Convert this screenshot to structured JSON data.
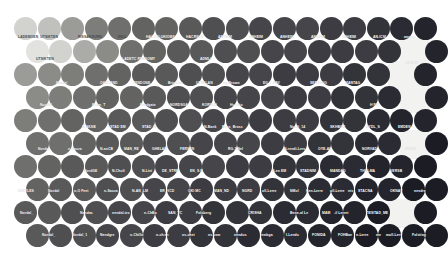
{
  "figure": {
    "kind": "dot-matrix-cartogram",
    "background": "#ffffff",
    "width": 438,
    "height": 260
  },
  "chart_data": {
    "type": "scatter",
    "title": "",
    "subtitle": "",
    "xlabel": "",
    "ylabel": "",
    "legend_position": "none",
    "grid": false,
    "packing": "hexagonal-offset-rows",
    "marker": "circle",
    "marker_diameter_px": 23,
    "row_pitch_px": 23,
    "col_pitch_px": 23.5,
    "rows": 10,
    "columns": 18,
    "colormap": {
      "name": "grayscale-sequential",
      "stops": [
        "#efefed",
        "#e2e2df",
        "#d2d2cf",
        "#c0c0bd",
        "#ababa8",
        "#9b9b98",
        "#8b8b88",
        "#7d7d7a",
        "#6f6f6d",
        "#636361",
        "#59595a",
        "#4f4f52",
        "#45454a",
        "#3c3c42",
        "#33333a",
        "#2b2b33",
        "#24242c",
        "#1c1c24"
      ],
      "direction": "light top-left to dark bottom-right"
    },
    "values": [
      [
        2,
        3,
        5,
        7,
        8,
        9,
        9,
        10,
        11,
        11,
        12,
        12,
        12,
        13,
        13,
        14,
        15,
        16
      ],
      [
        1,
        2,
        4,
        6,
        8,
        9,
        10,
        10,
        11,
        11,
        12,
        12,
        13,
        13,
        13,
        14,
        15,
        16
      ],
      [
        5,
        6,
        7,
        8,
        9,
        10,
        10,
        11,
        11,
        12,
        12,
        13,
        13,
        13,
        14,
        14,
        15,
        16
      ],
      [
        6,
        7,
        8,
        9,
        9,
        10,
        11,
        11,
        12,
        12,
        12,
        13,
        13,
        14,
        14,
        15,
        15,
        16
      ],
      [
        7,
        8,
        9,
        9,
        10,
        10,
        11,
        11,
        12,
        12,
        13,
        13,
        13,
        14,
        14,
        15,
        16,
        16
      ],
      [
        8,
        8,
        9,
        10,
        10,
        11,
        11,
        12,
        12,
        12,
        13,
        13,
        14,
        14,
        15,
        15,
        16,
        17
      ],
      [
        8,
        9,
        10,
        10,
        11,
        11,
        12,
        12,
        12,
        13,
        13,
        14,
        14,
        15,
        15,
        16,
        16,
        17
      ],
      [
        9,
        10,
        10,
        11,
        11,
        12,
        12,
        13,
        13,
        13,
        14,
        14,
        15,
        15,
        16,
        16,
        17,
        17
      ],
      [
        10,
        10,
        11,
        11,
        12,
        12,
        13,
        13,
        14,
        14,
        14,
        15,
        15,
        16,
        16,
        17,
        17,
        17
      ],
      [
        10,
        11,
        11,
        12,
        12,
        13,
        13,
        14,
        14,
        15,
        15,
        15,
        16,
        16,
        17,
        17,
        17,
        17
      ]
    ],
    "gaps": [
      {
        "row": 1,
        "col": 16
      },
      {
        "row": 2,
        "col": 16
      },
      {
        "row": 3,
        "col": 16
      },
      {
        "row": 5,
        "col": 16
      },
      {
        "row": 8,
        "col": 16
      }
    ],
    "annotations": [
      {
        "text": "LADEMOEN_UTSIKTEN",
        "x": 18,
        "y": 36,
        "tone": "dark"
      },
      {
        "text": "RISSAKKURKI",
        "x": 78,
        "y": 36,
        "tone": "dark"
      },
      {
        "text": "DELL",
        "x": 118,
        "y": 36,
        "tone": "dark"
      },
      {
        "text": "HACASLUKIOMS",
        "x": 146,
        "y": 36,
        "tone": "light"
      },
      {
        "text": "HACRSLU",
        "x": 186,
        "y": 36,
        "tone": "light"
      },
      {
        "text": "ANHEIM",
        "x": 218,
        "y": 36,
        "tone": "light"
      },
      {
        "text": "ANHEIM",
        "x": 249,
        "y": 36,
        "tone": "light"
      },
      {
        "text": "ANHEIM",
        "x": 280,
        "y": 36,
        "tone": "light"
      },
      {
        "text": "ANHEIM",
        "x": 311,
        "y": 36,
        "tone": "light"
      },
      {
        "text": "ANHEIM",
        "x": 342,
        "y": 36,
        "tone": "light"
      },
      {
        "text": "AN-ICM",
        "x": 373,
        "y": 36,
        "tone": "light"
      },
      {
        "text": "anvain",
        "x": 404,
        "y": 36,
        "tone": "light"
      },
      {
        "text": "UTSIKTEN",
        "x": 36,
        "y": 58,
        "tone": "dark"
      },
      {
        "text": "LADETC RENSOMY",
        "x": 122,
        "y": 58,
        "tone": "light"
      },
      {
        "text": "ADMLI",
        "x": 200,
        "y": 58,
        "tone": "light"
      },
      {
        "text": "AN-ICM",
        "x": 405,
        "y": 62,
        "tone": "light"
      },
      {
        "text": "Nordal_",
        "x": 56,
        "y": 82,
        "tone": "light"
      },
      {
        "text": "OAKLAND",
        "x": 100,
        "y": 82,
        "tone": "light"
      },
      {
        "text": "TENDONE",
        "x": 133,
        "y": 82,
        "tone": "light"
      },
      {
        "text": "Brighton",
        "x": 168,
        "y": 82,
        "tone": "light"
      },
      {
        "text": "UTSELAN",
        "x": 196,
        "y": 82,
        "tone": "light"
      },
      {
        "text": "ng-Brown",
        "x": 223,
        "y": 82,
        "tone": "light"
      },
      {
        "text": "EG T_FAV",
        "x": 263,
        "y": 82,
        "tone": "light"
      },
      {
        "text": "SERSAVG",
        "x": 310,
        "y": 82,
        "tone": "light"
      },
      {
        "text": "MANTAG",
        "x": 345,
        "y": 82,
        "tone": "light"
      },
      {
        "text": "NordEL",
        "x": 40,
        "y": 104,
        "tone": "light"
      },
      {
        "text": "Brian_T",
        "x": 92,
        "y": 104,
        "tone": "light"
      },
      {
        "text": "Nordgate",
        "x": 140,
        "y": 104,
        "tone": "light"
      },
      {
        "text": "NORDSGA",
        "x": 170,
        "y": 104,
        "tone": "light"
      },
      {
        "text": "KORSLU",
        "x": 202,
        "y": 104,
        "tone": "light"
      },
      {
        "text": "Hustrio",
        "x": 230,
        "y": 104,
        "tone": "light"
      },
      {
        "text": "H FU",
        "x": 370,
        "y": 104,
        "tone": "light"
      },
      {
        "text": "N-AKSB",
        "x": 82,
        "y": 126,
        "tone": "light"
      },
      {
        "text": "STAD EM",
        "x": 110,
        "y": 126,
        "tone": "light"
      },
      {
        "text": "STAD_M",
        "x": 142,
        "y": 126,
        "tone": "light"
      },
      {
        "text": "N-Bank",
        "x": 204,
        "y": 126,
        "tone": "light"
      },
      {
        "text": "Rens_Bross",
        "x": 222,
        "y": 126,
        "tone": "light"
      },
      {
        "text": "Nordi_14",
        "x": 290,
        "y": 126,
        "tone": "light"
      },
      {
        "text": "SKHBOR",
        "x": 330,
        "y": 126,
        "tone": "light"
      },
      {
        "text": "HYDL_S",
        "x": 366,
        "y": 126,
        "tone": "light"
      },
      {
        "text": "EMDEN",
        "x": 398,
        "y": 126,
        "tone": "light"
      },
      {
        "text": "Nordal",
        "x": 38,
        "y": 148,
        "tone": "light"
      },
      {
        "text": "n-Sauza",
        "x": 68,
        "y": 148,
        "tone": "light"
      },
      {
        "text": "N-anCB",
        "x": 100,
        "y": 148,
        "tone": "light"
      },
      {
        "text": "MAN_RE",
        "x": 124,
        "y": 148,
        "tone": "light"
      },
      {
        "text": "GHELAN",
        "x": 152,
        "y": 148,
        "tone": "light"
      },
      {
        "text": "FERSEN",
        "x": 180,
        "y": 148,
        "tone": "light"
      },
      {
        "text": "RG-1/Nel",
        "x": 228,
        "y": 148,
        "tone": "light"
      },
      {
        "text": "N-rendi-Lerv",
        "x": 284,
        "y": 148,
        "tone": "light"
      },
      {
        "text": "OYE-AL",
        "x": 318,
        "y": 148,
        "tone": "light"
      },
      {
        "text": "NORVAD",
        "x": 362,
        "y": 148,
        "tone": "light"
      },
      {
        "text": "MHCM",
        "x": 405,
        "y": 148,
        "tone": "light"
      },
      {
        "text": "NordGE",
        "x": 84,
        "y": 170,
        "tone": "light"
      },
      {
        "text": "N-Chuli",
        "x": 112,
        "y": 170,
        "tone": "light"
      },
      {
        "text": "N-Livi",
        "x": 142,
        "y": 170,
        "tone": "light"
      },
      {
        "text": "DE_STRE",
        "x": 162,
        "y": 170,
        "tone": "light"
      },
      {
        "text": "EN_S.N",
        "x": 190,
        "y": 170,
        "tone": "light"
      },
      {
        "text": "N-en EM",
        "x": 272,
        "y": 170,
        "tone": "light"
      },
      {
        "text": "STADNIM",
        "x": 300,
        "y": 170,
        "tone": "light"
      },
      {
        "text": "MANDAG",
        "x": 330,
        "y": 170,
        "tone": "light"
      },
      {
        "text": "THOLMA",
        "x": 360,
        "y": 170,
        "tone": "light"
      },
      {
        "text": "VERSB",
        "x": 390,
        "y": 170,
        "tone": "light"
      },
      {
        "text": "NJETLES",
        "x": 18,
        "y": 190,
        "tone": "light"
      },
      {
        "text": "Nordal",
        "x": 48,
        "y": 190,
        "tone": "light"
      },
      {
        "text": "n-O Feet",
        "x": 74,
        "y": 190,
        "tone": "light"
      },
      {
        "text": "n-Sauza",
        "x": 104,
        "y": 190,
        "tone": "light"
      },
      {
        "text": "N-AN_LM",
        "x": 132,
        "y": 190,
        "tone": "light"
      },
      {
        "text": "ER_VCD",
        "x": 160,
        "y": 190,
        "tone": "light"
      },
      {
        "text": "OKI MC",
        "x": 188,
        "y": 190,
        "tone": "light"
      },
      {
        "text": "MAN_ND",
        "x": 214,
        "y": 190,
        "tone": "light"
      },
      {
        "text": "NGRD",
        "x": 242,
        "y": 190,
        "tone": "light"
      },
      {
        "text": "oll-Lerre",
        "x": 262,
        "y": 190,
        "tone": "light"
      },
      {
        "text": "NMol",
        "x": 290,
        "y": 190,
        "tone": "light"
      },
      {
        "text": "Ren-Lerre",
        "x": 306,
        "y": 190,
        "tone": "light"
      },
      {
        "text": "oll-Lerre",
        "x": 330,
        "y": 190,
        "tone": "light"
      },
      {
        "text": "nts",
        "x": 348,
        "y": 190,
        "tone": "light"
      },
      {
        "text": "STACNA",
        "x": 358,
        "y": 190,
        "tone": "light"
      },
      {
        "text": "OKNAV",
        "x": 390,
        "y": 190,
        "tone": "light"
      },
      {
        "text": "nevdre",
        "x": 414,
        "y": 190,
        "tone": "light"
      },
      {
        "text": "Nordal_",
        "x": 20,
        "y": 212,
        "tone": "light"
      },
      {
        "text": "Nandas",
        "x": 80,
        "y": 212,
        "tone": "light"
      },
      {
        "text": "nendal-tro",
        "x": 112,
        "y": 212,
        "tone": "light"
      },
      {
        "text": "n-ChBa",
        "x": 144,
        "y": 212,
        "tone": "light"
      },
      {
        "text": "SAN_VC",
        "x": 168,
        "y": 212,
        "tone": "light"
      },
      {
        "text": "Folsberg",
        "x": 196,
        "y": 212,
        "tone": "light"
      },
      {
        "text": "CRISHA",
        "x": 248,
        "y": 212,
        "tone": "light"
      },
      {
        "text": "Bene-al Le",
        "x": 290,
        "y": 212,
        "tone": "light"
      },
      {
        "text": "MAM",
        "x": 322,
        "y": 212,
        "tone": "light"
      },
      {
        "text": "-il Lerret",
        "x": 334,
        "y": 212,
        "tone": "light"
      },
      {
        "text": "TEISTAD_ME",
        "x": 366,
        "y": 212,
        "tone": "light"
      },
      {
        "text": "Nordal_",
        "x": 42,
        "y": 234,
        "tone": "light"
      },
      {
        "text": "Nordal_1",
        "x": 72,
        "y": 234,
        "tone": "light"
      },
      {
        "text": "Nendgre",
        "x": 100,
        "y": 234,
        "tone": "light"
      },
      {
        "text": "n-Chillo",
        "x": 130,
        "y": 234,
        "tone": "light"
      },
      {
        "text": "n-ch.en",
        "x": 156,
        "y": 234,
        "tone": "light"
      },
      {
        "text": "os-chet",
        "x": 182,
        "y": 234,
        "tone": "light"
      },
      {
        "text": "ns.com",
        "x": 208,
        "y": 234,
        "tone": "light"
      },
      {
        "text": "nendus",
        "x": 234,
        "y": 234,
        "tone": "light"
      },
      {
        "text": "tembga",
        "x": 260,
        "y": 234,
        "tone": "light"
      },
      {
        "text": "l-Lendu",
        "x": 286,
        "y": 234,
        "tone": "light"
      },
      {
        "text": "FONIDA",
        "x": 312,
        "y": 234,
        "tone": "light"
      },
      {
        "text": "FOHBae",
        "x": 338,
        "y": 234,
        "tone": "light"
      },
      {
        "text": "n-Lerre",
        "x": 356,
        "y": 234,
        "tone": "light"
      },
      {
        "text": "mv",
        "x": 376,
        "y": 234,
        "tone": "light"
      },
      {
        "text": "moll-Lerv",
        "x": 386,
        "y": 234,
        "tone": "light"
      },
      {
        "text": "Folsting",
        "x": 412,
        "y": 234,
        "tone": "light"
      }
    ]
  }
}
